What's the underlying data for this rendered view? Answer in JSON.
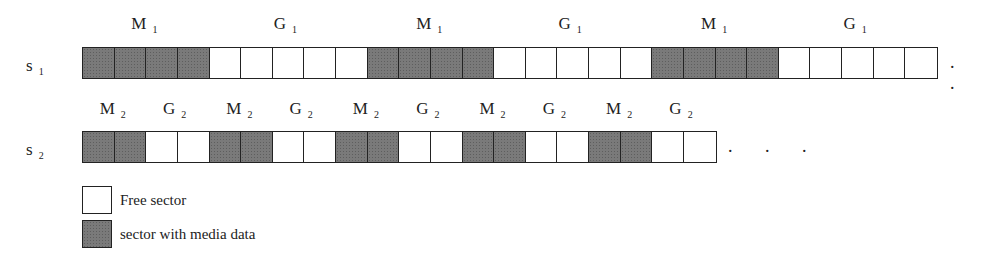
{
  "rows": [
    {
      "label": "s",
      "label_sub": "1",
      "pattern": [
        1,
        1,
        1,
        1,
        0,
        0,
        0,
        0,
        0,
        1,
        1,
        1,
        1,
        0,
        0,
        0,
        0,
        0,
        1,
        1,
        1,
        1,
        0,
        0,
        0,
        0,
        0
      ],
      "segments": [
        {
          "name": "M",
          "sub": "1"
        },
        {
          "name": "G",
          "sub": "1"
        },
        {
          "name": "M",
          "sub": "1"
        },
        {
          "name": "G",
          "sub": "1"
        },
        {
          "name": "M",
          "sub": "1"
        },
        {
          "name": "G",
          "sub": "1"
        }
      ],
      "ellipsis": ". ."
    },
    {
      "label": "s",
      "label_sub": "2",
      "pattern": [
        1,
        1,
        0,
        0,
        1,
        1,
        0,
        0,
        1,
        1,
        0,
        0,
        1,
        1,
        0,
        0,
        1,
        1,
        0,
        0
      ],
      "segments": [
        {
          "name": "M",
          "sub": "2"
        },
        {
          "name": "G",
          "sub": "2"
        },
        {
          "name": "M",
          "sub": "2"
        },
        {
          "name": "G",
          "sub": "2"
        },
        {
          "name": "M",
          "sub": "2"
        },
        {
          "name": "G",
          "sub": "2"
        },
        {
          "name": "M",
          "sub": "2"
        },
        {
          "name": "G",
          "sub": "2"
        },
        {
          "name": "M",
          "sub": "2"
        },
        {
          "name": "G",
          "sub": "2"
        }
      ],
      "ellipsis": ". . ."
    }
  ],
  "legend": [
    {
      "type": "free",
      "label": "Free sector"
    },
    {
      "type": "media",
      "label": "sector with media data"
    }
  ],
  "colors": {
    "media_fill": "#7a7a7a",
    "free_fill": "#ffffff",
    "stroke": "#222222"
  }
}
